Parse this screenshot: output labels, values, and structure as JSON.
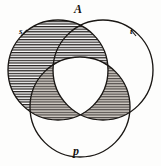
{
  "figure": {
    "type": "venn-diagram-three-set",
    "title_label": "A",
    "background_color": "#fdfdfc",
    "stroke_color": "#1a1714",
    "hatch_color": "#2a2622",
    "shade_fill": "#b9b4ad"
  },
  "labels": {
    "top": "A",
    "bottom": "p",
    "left": "s",
    "right": "t"
  },
  "circles": [
    {
      "name": "left-circle",
      "cx": 58,
      "cy": 70,
      "r": 50,
      "fill": "hatched"
    },
    {
      "name": "right-circle",
      "cx": 103,
      "cy": 70,
      "r": 50,
      "fill": "none"
    },
    {
      "name": "bottom-circle",
      "cx": 80,
      "cy": 107,
      "r": 50,
      "fill": "none"
    }
  ],
  "regions": [
    {
      "name": "left-only",
      "shading": "hatched"
    },
    {
      "name": "left-and-right",
      "shading": "hatched"
    },
    {
      "name": "left-and-bottom",
      "shading": "hatched-grey"
    },
    {
      "name": "right-and-bottom",
      "shading": "hatched-grey"
    },
    {
      "name": "left-right-bottom",
      "shading": "none"
    },
    {
      "name": "right-only",
      "shading": "none"
    },
    {
      "name": "bottom-only",
      "shading": "none"
    }
  ]
}
